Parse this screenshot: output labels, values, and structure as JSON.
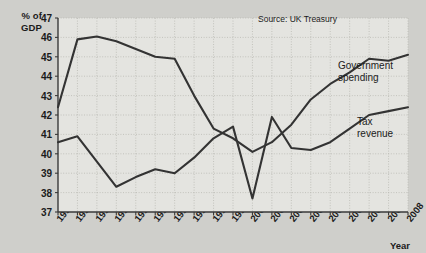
{
  "chart_data": {
    "type": "line",
    "title": "",
    "xlabel": "Year",
    "ylabel": "% of GDP",
    "ylim": [
      37,
      47
    ],
    "ytick_values": [
      37,
      38,
      39,
      40,
      41,
      42,
      43,
      44,
      45,
      46,
      47
    ],
    "grid": true,
    "legend_position": "inline-annotations",
    "source_note": "Source: UK Treasury",
    "categories": [
      "1990",
      "1991",
      "1992",
      "1993",
      "1994",
      "1995",
      "1996",
      "1997",
      "1998",
      "1999",
      "2000",
      "2001",
      "2002",
      "2003",
      "2004",
      "2005",
      "2006",
      "2007",
      "2008"
    ],
    "series": [
      {
        "name": "Government spending",
        "color": "#333333",
        "values": [
          42.4,
          45.9,
          46.05,
          45.8,
          45.4,
          45.0,
          44.9,
          43.0,
          41.3,
          40.8,
          40.1,
          40.6,
          41.5,
          42.8,
          43.6,
          44.2,
          44.9,
          44.8,
          45.1
        ]
      },
      {
        "name": "Tax revenue",
        "color": "#333333",
        "values": [
          40.6,
          40.9,
          39.6,
          38.3,
          38.8,
          39.2,
          39.0,
          39.8,
          40.8,
          41.4,
          37.7,
          41.9,
          40.3,
          40.2,
          40.6,
          41.3,
          42.0,
          42.2,
          42.4
        ]
      }
    ],
    "annotations": [
      {
        "text": "Government\nspending",
        "series": "Government spending"
      },
      {
        "text": "Tax\nrevenue",
        "series": "Tax revenue"
      }
    ]
  },
  "axis_title_text": "% of\nGDP",
  "colors": {
    "page_background": "#cfcfcb",
    "plot_background": "#e4e4e0",
    "line": "#333333",
    "grid": "#b4b4ae",
    "axis": "#3a3a3a",
    "text": "#1b1b1b"
  }
}
